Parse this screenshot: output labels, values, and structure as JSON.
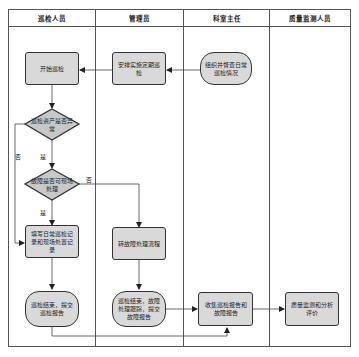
{
  "diagram": {
    "type": "swimlane-flowchart",
    "lanes": [
      {
        "id": "inspector",
        "title": "巡检人员"
      },
      {
        "id": "admin",
        "title": "管理员"
      },
      {
        "id": "director",
        "title": "科室主任"
      },
      {
        "id": "qc",
        "title": "质量监测人员"
      }
    ],
    "nodes": {
      "start_inspection": {
        "lane": "inspector",
        "shape": "rect",
        "text": "开始巡检"
      },
      "arrange_regular": {
        "lane": "admin",
        "shape": "rect",
        "text": "安排实施定期巡检"
      },
      "organize_supervise": {
        "lane": "director",
        "shape": "terminator",
        "text": "组织并督查日常巡检情况"
      },
      "asset_abnormal": {
        "lane": "inspector",
        "shape": "decision",
        "text": "巡检资产是否异常"
      },
      "fault_onsite": {
        "lane": "inspector",
        "shape": "decision",
        "text": "故障是否可现场处理"
      },
      "fill_record": {
        "lane": "inspector",
        "shape": "rect",
        "text": "填写日常巡检记录和现场处置记录"
      },
      "transfer_fault": {
        "lane": "admin",
        "shape": "rect",
        "text": "转故障处理流程"
      },
      "submit_report": {
        "lane": "inspector",
        "shape": "terminator",
        "text": "巡检结束，提交巡检报告"
      },
      "fault_followup": {
        "lane": "admin",
        "shape": "terminator",
        "text": "巡检结束，故障处理跟踪，提交故障报告"
      },
      "collect_reports": {
        "lane": "director",
        "shape": "rect",
        "text": "收集巡检报告和故障报告"
      },
      "qc_analysis": {
        "lane": "qc",
        "shape": "rect",
        "text": "质量监测和分析评价"
      }
    },
    "edge_labels": {
      "yes": "是",
      "no": "否"
    },
    "edges": [
      {
        "from": "organize_supervise",
        "to": "arrange_regular"
      },
      {
        "from": "arrange_regular",
        "to": "start_inspection"
      },
      {
        "from": "start_inspection",
        "to": "asset_abnormal"
      },
      {
        "from": "asset_abnormal",
        "to": "fault_onsite",
        "label": "是"
      },
      {
        "from": "asset_abnormal",
        "to": "fill_record",
        "label": "否"
      },
      {
        "from": "fault_onsite",
        "to": "fill_record",
        "label": "是"
      },
      {
        "from": "fault_onsite",
        "to": "transfer_fault",
        "label": "否"
      },
      {
        "from": "fill_record",
        "to": "submit_report"
      },
      {
        "from": "transfer_fault",
        "to": "fault_followup"
      },
      {
        "from": "fault_followup",
        "to": "collect_reports"
      },
      {
        "from": "submit_report",
        "to": "collect_reports"
      },
      {
        "from": "collect_reports",
        "to": "qc_analysis"
      }
    ]
  }
}
